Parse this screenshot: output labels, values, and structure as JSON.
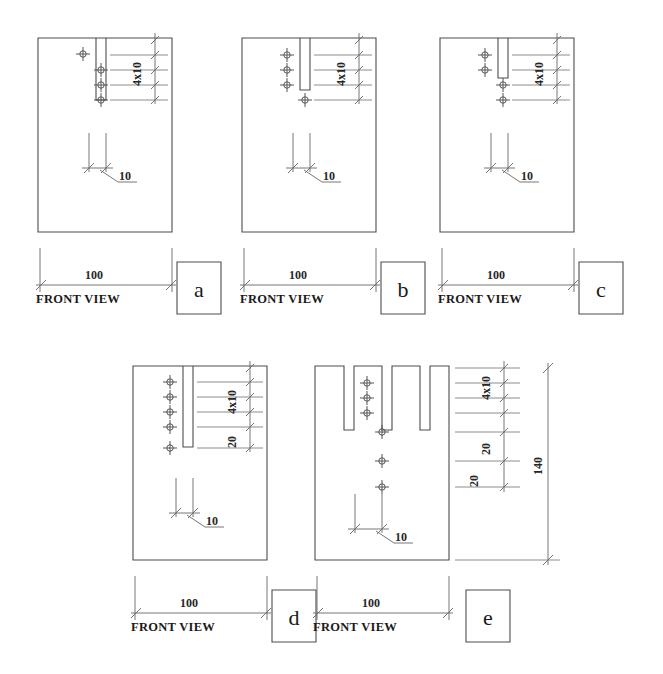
{
  "page": {
    "background_color": "#ffffff",
    "line_color": "#4d4d4d",
    "thin_line_color": "#808080",
    "text_color": "#1a1a1a",
    "width": 663,
    "height": 674
  },
  "figures": [
    {
      "id": "a",
      "key_label": "a",
      "view_label": "FRONT VIEW",
      "width_dim": "100",
      "slot_dim": "10",
      "spacing_dim": "4x10",
      "extra_dims": [],
      "holes_left_of_slot": 1,
      "holes_on_centerline": 3,
      "slot_count": 1
    },
    {
      "id": "b",
      "key_label": "b",
      "view_label": "FRONT VIEW",
      "width_dim": "100",
      "slot_dim": "10",
      "spacing_dim": "4x10",
      "extra_dims": [],
      "holes_left_of_slot": 3,
      "holes_on_centerline": 1,
      "slot_count": 1
    },
    {
      "id": "c",
      "key_label": "c",
      "view_label": "FRONT VIEW",
      "width_dim": "100",
      "slot_dim": "10",
      "spacing_dim": "4x10",
      "extra_dims": [],
      "holes_left_of_slot": 2,
      "holes_on_centerline": 2,
      "slot_count": 1
    },
    {
      "id": "d",
      "key_label": "d",
      "view_label": "FRONT VIEW",
      "width_dim": "100",
      "slot_dim": "10",
      "spacing_dim": "4x10",
      "extra_dims": [
        "20"
      ],
      "holes_left_of_slot": 4,
      "holes_on_centerline": 1,
      "slot_count": 1
    },
    {
      "id": "e",
      "key_label": "e",
      "view_label": "FRONT VIEW",
      "width_dim": "100",
      "slot_dim": "10",
      "spacing_dim": "4x10",
      "extra_dims": [
        "20",
        "20",
        "140"
      ],
      "holes_left_of_slot": 3,
      "holes_on_centerline": 3,
      "slot_count": 3
    }
  ],
  "labels": {
    "front_view": "FRONT VIEW",
    "width_100": "100",
    "slot_10": "10",
    "pitch_4x10": "4x10",
    "dim_20": "20",
    "dim_140": "140",
    "key_a": "a",
    "key_b": "b",
    "key_c": "c",
    "key_d": "d",
    "key_e": "e"
  }
}
